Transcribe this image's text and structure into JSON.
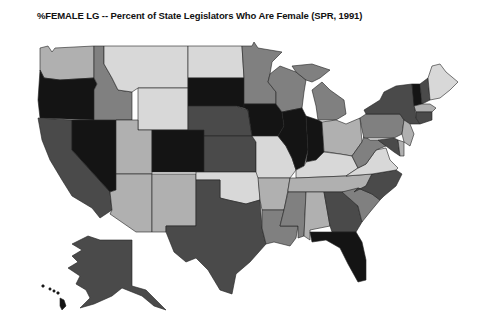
{
  "title": "%FEMALE LG -- Percent of State Legislators Who Are Female (SPR, 1991)",
  "shades": {
    "lightest": "#d8d8d8",
    "light": "#b0b0b0",
    "medium": "#808080",
    "dark": "#4a4a4a",
    "darkest": "#141414"
  },
  "states": [
    {
      "abbr": "WA",
      "shade": "light"
    },
    {
      "abbr": "OR",
      "shade": "darkest"
    },
    {
      "abbr": "CA",
      "shade": "dark"
    },
    {
      "abbr": "ID",
      "shade": "medium"
    },
    {
      "abbr": "NV",
      "shade": "darkest"
    },
    {
      "abbr": "MT",
      "shade": "lightest"
    },
    {
      "abbr": "WY",
      "shade": "lightest"
    },
    {
      "abbr": "UT",
      "shade": "light"
    },
    {
      "abbr": "AZ",
      "shade": "light"
    },
    {
      "abbr": "CO",
      "shade": "darkest"
    },
    {
      "abbr": "NM",
      "shade": "light"
    },
    {
      "abbr": "ND",
      "shade": "lightest"
    },
    {
      "abbr": "SD",
      "shade": "darkest"
    },
    {
      "abbr": "NE",
      "shade": "dark"
    },
    {
      "abbr": "KS",
      "shade": "dark"
    },
    {
      "abbr": "OK",
      "shade": "lightest"
    },
    {
      "abbr": "TX",
      "shade": "dark"
    },
    {
      "abbr": "MN",
      "shade": "medium"
    },
    {
      "abbr": "IA",
      "shade": "darkest"
    },
    {
      "abbr": "MO",
      "shade": "lightest"
    },
    {
      "abbr": "AR",
      "shade": "light"
    },
    {
      "abbr": "LA",
      "shade": "medium"
    },
    {
      "abbr": "WI",
      "shade": "medium"
    },
    {
      "abbr": "IL",
      "shade": "darkest"
    },
    {
      "abbr": "MI",
      "shade": "medium"
    },
    {
      "abbr": "IN",
      "shade": "darkest"
    },
    {
      "abbr": "OH",
      "shade": "light"
    },
    {
      "abbr": "KY",
      "shade": "lightest"
    },
    {
      "abbr": "TN",
      "shade": "light"
    },
    {
      "abbr": "MS",
      "shade": "medium"
    },
    {
      "abbr": "AL",
      "shade": "light"
    },
    {
      "abbr": "GA",
      "shade": "dark"
    },
    {
      "abbr": "FL",
      "shade": "darkest"
    },
    {
      "abbr": "SC",
      "shade": "medium"
    },
    {
      "abbr": "NC",
      "shade": "dark"
    },
    {
      "abbr": "VA",
      "shade": "lightest"
    },
    {
      "abbr": "WV",
      "shade": "medium"
    },
    {
      "abbr": "PA",
      "shade": "medium"
    },
    {
      "abbr": "NY",
      "shade": "dark"
    },
    {
      "abbr": "VT",
      "shade": "darkest"
    },
    {
      "abbr": "NH",
      "shade": "dark"
    },
    {
      "abbr": "ME",
      "shade": "lightest"
    },
    {
      "abbr": "MA",
      "shade": "light"
    },
    {
      "abbr": "CT",
      "shade": "dark"
    },
    {
      "abbr": "NJ",
      "shade": "light"
    },
    {
      "abbr": "MD",
      "shade": "dark"
    },
    {
      "abbr": "DE",
      "shade": "light"
    },
    {
      "abbr": "AK",
      "shade": "dark"
    },
    {
      "abbr": "HI",
      "shade": "darkest"
    }
  ]
}
